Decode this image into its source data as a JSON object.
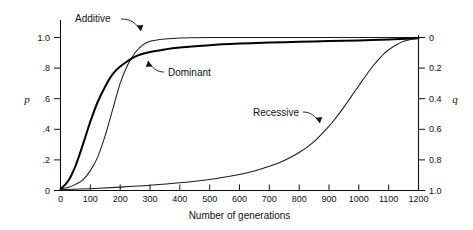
{
  "chart_data": {
    "type": "line",
    "title": "",
    "xlabel": "Number of generations",
    "ylabel": "p",
    "ylabel_right": "q",
    "xlim": [
      0,
      1200
    ],
    "ylim": [
      0,
      1.0
    ],
    "ylim_right": [
      1.0,
      0.0
    ],
    "grid": false,
    "legend": "none",
    "xticks": [
      0,
      100,
      200,
      300,
      400,
      500,
      600,
      700,
      800,
      900,
      1000,
      1100,
      1200
    ],
    "xtick_labels": [
      "0",
      "100",
      "200",
      "300",
      "400",
      "500",
      "600",
      "700",
      "800",
      "900",
      "1000",
      "1100",
      "1200"
    ],
    "yticks": [
      0,
      0.2,
      0.4,
      0.6,
      0.8,
      1.0
    ],
    "ytick_labels": [
      "0",
      ".2",
      ".4",
      ".6",
      ".8",
      "1.0"
    ],
    "yticks_right": [
      0,
      0.2,
      0.4,
      0.6,
      0.8,
      1.0
    ],
    "ytick_labels_right": [
      "0",
      "0.2",
      "0.4",
      "0.6",
      "0.8",
      "1.0"
    ],
    "series": [
      {
        "name": "Additive",
        "style": "thin",
        "x": [
          0,
          25,
          50,
          75,
          100,
          125,
          150,
          175,
          200,
          225,
          250,
          275,
          300,
          350,
          400,
          500,
          600,
          700,
          800,
          900,
          1000,
          1100,
          1200
        ],
        "values": [
          0.01,
          0.02,
          0.04,
          0.07,
          0.13,
          0.22,
          0.36,
          0.53,
          0.7,
          0.82,
          0.9,
          0.95,
          0.975,
          0.99,
          0.997,
          1.0,
          1.0,
          1.0,
          1.0,
          1.0,
          1.0,
          1.0,
          1.0
        ]
      },
      {
        "name": "Dominant",
        "style": "thick",
        "x": [
          0,
          25,
          50,
          75,
          100,
          125,
          150,
          175,
          200,
          250,
          300,
          350,
          400,
          500,
          600,
          700,
          800,
          900,
          1000,
          1100,
          1200
        ],
        "values": [
          0.01,
          0.06,
          0.16,
          0.3,
          0.45,
          0.58,
          0.68,
          0.76,
          0.81,
          0.875,
          0.905,
          0.922,
          0.934,
          0.95,
          0.96,
          0.967,
          0.972,
          0.977,
          0.981,
          0.987,
          0.995
        ]
      },
      {
        "name": "Recessive",
        "style": "thin",
        "x": [
          0,
          100,
          200,
          300,
          400,
          500,
          600,
          650,
          700,
          750,
          800,
          850,
          900,
          925,
          950,
          975,
          1000,
          1025,
          1050,
          1075,
          1100,
          1150,
          1200
        ],
        "values": [
          0.005,
          0.012,
          0.022,
          0.034,
          0.05,
          0.072,
          0.105,
          0.128,
          0.158,
          0.196,
          0.248,
          0.32,
          0.42,
          0.48,
          0.545,
          0.615,
          0.685,
          0.755,
          0.82,
          0.875,
          0.92,
          0.975,
          0.995
        ]
      }
    ],
    "annotations": [
      {
        "label": "Additive",
        "text_x": 75,
        "text_y": 22
      },
      {
        "label": "Dominant",
        "text_x": 168,
        "text_y": 73
      },
      {
        "label": "Recessive",
        "text_x": 253,
        "text_y": 113
      }
    ]
  }
}
